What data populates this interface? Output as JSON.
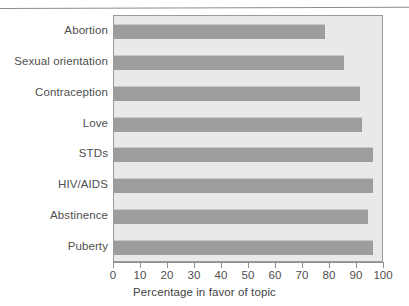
{
  "chart_data": {
    "type": "bar",
    "orientation": "horizontal",
    "title": "",
    "xlabel": "Percentage in favor of topic",
    "ylabel": "",
    "xlim": [
      0,
      100
    ],
    "xticks": [
      0,
      10,
      20,
      30,
      40,
      50,
      60,
      70,
      80,
      90,
      100
    ],
    "grid": false,
    "legend": null,
    "categories": [
      "Abortion",
      "Sexual orientation",
      "Contraception",
      "Love",
      "STDs",
      "HIV/AIDS",
      "Abstinence",
      "Puberty"
    ],
    "values": [
      78,
      85,
      91,
      92,
      96,
      96,
      94,
      96
    ]
  },
  "style": {
    "bar_color": "#9d9d9d",
    "plot_background": "#e9e9e9",
    "plot_border": "#9b9b9b",
    "axis_color": "#8f8f8f",
    "text_color": "#4f4f4f"
  }
}
